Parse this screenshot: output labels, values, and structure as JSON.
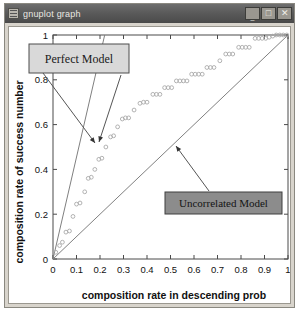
{
  "window": {
    "title": "gnuplot graph",
    "icon": "gnuplot-app-icon",
    "buttons": {
      "minimize": "_",
      "maximize": "□",
      "close": "✕"
    }
  },
  "chart_data": {
    "type": "scatter",
    "title": "",
    "xlabel": "composition rate in descending prob",
    "ylabel": "composition rate of success number",
    "xlim": [
      0,
      1
    ],
    "ylim": [
      0,
      1
    ],
    "xticks": [
      "0",
      "0.1",
      "0.2",
      "0.3",
      "0.4",
      "0.5",
      "0.6",
      "0.7",
      "0.8",
      "0.9",
      "1"
    ],
    "xtick_values": [
      0,
      0.1,
      0.2,
      0.3,
      0.4,
      0.5,
      0.6,
      0.7,
      0.8,
      0.9,
      1
    ],
    "yticks": [
      "0",
      "0.2",
      "0.4",
      "0.6",
      "0.8",
      "1"
    ],
    "ytick_values": [
      0,
      0.2,
      0.4,
      0.6,
      0.8,
      1
    ],
    "grid": false,
    "legend": "none",
    "series": [
      {
        "name": "Perfect Model",
        "type": "line",
        "color": "#808080",
        "points": [
          [
            0,
            0
          ],
          [
            0.22,
            1.0
          ]
        ]
      },
      {
        "name": "Uncorrelated Model",
        "type": "line",
        "color": "#808080",
        "points": [
          [
            0,
            0
          ],
          [
            1.0,
            1.0
          ]
        ]
      },
      {
        "name": "data",
        "type": "scatter",
        "marker": "open-circle",
        "color": "#a9a9a9",
        "points": [
          [
            0.012,
            0.03
          ],
          [
            0.028,
            0.06
          ],
          [
            0.04,
            0.075
          ],
          [
            0.055,
            0.12
          ],
          [
            0.07,
            0.125
          ],
          [
            0.085,
            0.19
          ],
          [
            0.1,
            0.245
          ],
          [
            0.115,
            0.25
          ],
          [
            0.135,
            0.3
          ],
          [
            0.15,
            0.36
          ],
          [
            0.163,
            0.365
          ],
          [
            0.178,
            0.4
          ],
          [
            0.195,
            0.445
          ],
          [
            0.208,
            0.45
          ],
          [
            0.225,
            0.5
          ],
          [
            0.245,
            0.545
          ],
          [
            0.258,
            0.55
          ],
          [
            0.275,
            0.59
          ],
          [
            0.295,
            0.625
          ],
          [
            0.308,
            0.63
          ],
          [
            0.322,
            0.63
          ],
          [
            0.345,
            0.665
          ],
          [
            0.37,
            0.695
          ],
          [
            0.385,
            0.7
          ],
          [
            0.4,
            0.7
          ],
          [
            0.425,
            0.735
          ],
          [
            0.44,
            0.735
          ],
          [
            0.455,
            0.735
          ],
          [
            0.475,
            0.765
          ],
          [
            0.49,
            0.765
          ],
          [
            0.505,
            0.765
          ],
          [
            0.525,
            0.795
          ],
          [
            0.54,
            0.795
          ],
          [
            0.555,
            0.795
          ],
          [
            0.57,
            0.795
          ],
          [
            0.59,
            0.825
          ],
          [
            0.605,
            0.825
          ],
          [
            0.62,
            0.825
          ],
          [
            0.635,
            0.825
          ],
          [
            0.655,
            0.855
          ],
          [
            0.67,
            0.855
          ],
          [
            0.685,
            0.855
          ],
          [
            0.71,
            0.885
          ],
          [
            0.735,
            0.915
          ],
          [
            0.75,
            0.915
          ],
          [
            0.765,
            0.915
          ],
          [
            0.79,
            0.945
          ],
          [
            0.805,
            0.945
          ],
          [
            0.82,
            0.945
          ],
          [
            0.835,
            0.945
          ],
          [
            0.86,
            0.985
          ],
          [
            0.875,
            0.985
          ],
          [
            0.89,
            0.985
          ],
          [
            0.905,
            0.985
          ],
          [
            0.92,
            0.99
          ],
          [
            0.935,
            0.995
          ],
          [
            0.95,
            1.0
          ],
          [
            0.965,
            1.0
          ],
          [
            0.98,
            1.0
          ],
          [
            0.995,
            1.0
          ]
        ]
      }
    ],
    "annotations": [
      {
        "name": "perfect-model-label",
        "text": "Perfect Model",
        "box": {
          "fill": "#d9d9d9",
          "stroke": "#4d4d4d"
        },
        "arrow_targets": 2
      },
      {
        "name": "uncorrelated-model-label",
        "text": "Uncorrelated Model",
        "box": {
          "fill": "#8c8c8c",
          "stroke": "#3f3f3f"
        },
        "arrow_targets": 1
      }
    ]
  }
}
